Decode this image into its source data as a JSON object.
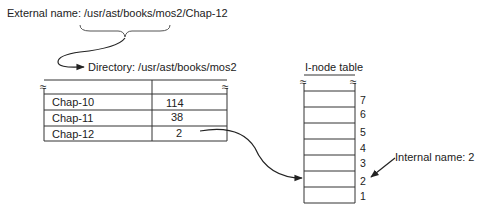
{
  "external_name": {
    "label": "External name: /usr/ast/books/mos2/Chap-12"
  },
  "directory": {
    "title": "Directory: /usr/ast/books/mos2",
    "rows": [
      {
        "name": "Chap-10",
        "inode": "114"
      },
      {
        "name": "Chap-11",
        "inode": "38"
      },
      {
        "name": "Chap-12",
        "inode": "2"
      }
    ],
    "break_symbol": "≈"
  },
  "inode_table": {
    "title": "I-node table",
    "row_numbers": [
      "7",
      "6",
      "5",
      "4",
      "3",
      "2",
      "1"
    ],
    "break_symbol": "≈"
  },
  "internal_name": {
    "label": "Internal name: 2"
  },
  "colors": {
    "line": "#333333",
    "text": "#222222"
  }
}
